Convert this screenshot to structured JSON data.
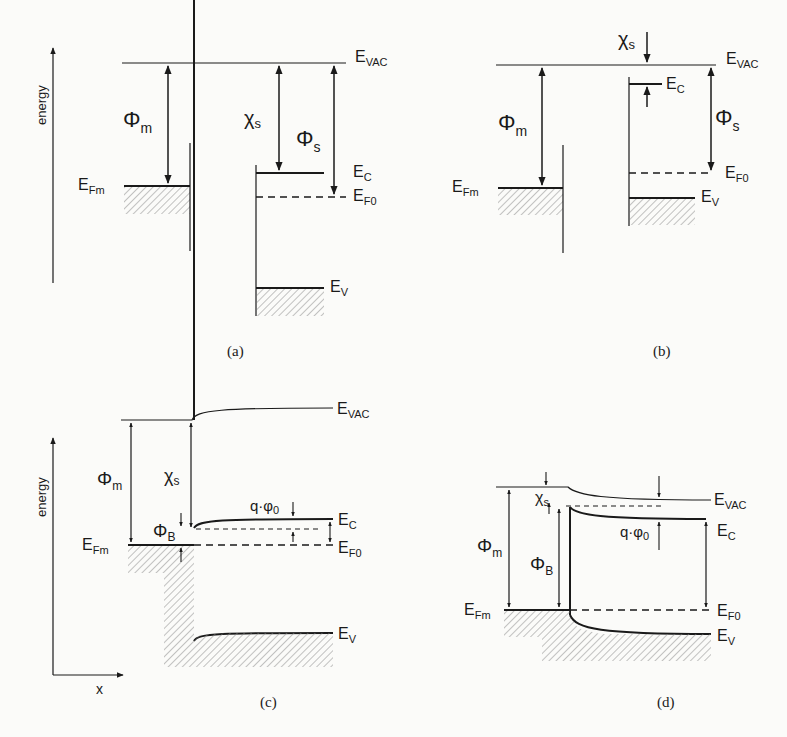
{
  "figure": {
    "panels": [
      {
        "id": "a",
        "caption": "(a)",
        "axis_label": "energy",
        "labels": {
          "evac": "E",
          "evac_sub": "VAC",
          "phi_m": "Φ",
          "phi_m_sub": "m",
          "chi_s": "χ",
          "chi_s_sub": "s",
          "phi_s": "Φ",
          "phi_s_sub": "s",
          "efm": "E",
          "efm_sub": "Fm",
          "ec": "E",
          "ec_sub": "C",
          "ef0": "E",
          "ef0_sub": "F0",
          "ev": "E",
          "ev_sub": "V"
        }
      },
      {
        "id": "b",
        "caption": "(b)",
        "labels": {
          "chi_s": "χ",
          "chi_s_sub": "s",
          "evac": "E",
          "evac_sub": "VAC",
          "ec": "E",
          "ec_sub": "C",
          "phi_m": "Φ",
          "phi_m_sub": "m",
          "phi_s": "Φ",
          "phi_s_sub": "s",
          "efm": "E",
          "efm_sub": "Fm",
          "ef0": "E",
          "ef0_sub": "F0",
          "ev": "E",
          "ev_sub": "V"
        }
      },
      {
        "id": "c",
        "caption": "(c)",
        "axis_label": "energy",
        "x_label": "x",
        "labels": {
          "evac": "E",
          "evac_sub": "VAC",
          "phi_m": "Φ",
          "phi_m_sub": "m",
          "chi_s": "χ",
          "chi_s_sub": "s",
          "qphi": "q·φ",
          "qphi_sub": "0",
          "phi_b": "Φ",
          "phi_b_sub": "B",
          "efm": "E",
          "efm_sub": "Fm",
          "ec": "E",
          "ec_sub": "C",
          "ef0": "E",
          "ef0_sub": "F0",
          "ev": "E",
          "ev_sub": "V"
        }
      },
      {
        "id": "d",
        "caption": "(d)",
        "labels": {
          "evac": "E",
          "evac_sub": "VAC",
          "chi_s": "χ",
          "chi_s_sub": "s",
          "phi_m": "Φ",
          "phi_m_sub": "m",
          "phi_b": "Φ",
          "phi_b_sub": "B",
          "qphi": "q·φ",
          "qphi_sub": "0",
          "ec": "E",
          "ec_sub": "C",
          "efm": "E",
          "efm_sub": "Fm",
          "ef0": "E",
          "ef0_sub": "F0",
          "ev": "E",
          "ev_sub": "V"
        }
      }
    ]
  }
}
